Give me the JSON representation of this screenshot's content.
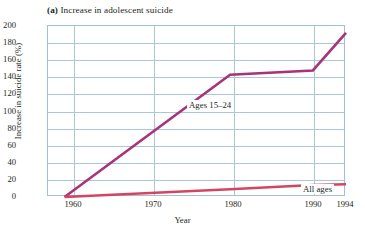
{
  "title": {
    "tag": "(a)",
    "text": " Increase in adolescent suicide"
  },
  "axes": {
    "xlabel": "Year",
    "ylabel": "Increase in suicide rate (%)",
    "ytick_labels": [
      "200",
      "180",
      "160",
      "140",
      "120",
      "100",
      "80",
      "60",
      "40",
      "20",
      "0"
    ],
    "xtick_labels": [
      "1960",
      "1970",
      "1980",
      "1990",
      "1994"
    ]
  },
  "colors": {
    "grid": "#a8c6de",
    "frame": "#9fc0da",
    "ages_15_24": "#a8337d",
    "all_ages": "#d4455f",
    "text": "#231f20",
    "background": "#ffffff"
  },
  "chart_data": {
    "type": "line",
    "title": "(a) Increase in adolescent suicide",
    "xlabel": "Year",
    "ylabel": "Increase in suicide rate (%)",
    "xlim": [
      1958,
      1994
    ],
    "ylim": [
      0,
      200
    ],
    "xticks": [
      1960,
      1970,
      1980,
      1990,
      1994
    ],
    "yticks": [
      0,
      20,
      40,
      60,
      80,
      100,
      120,
      140,
      160,
      180,
      200
    ],
    "grid": true,
    "legend": "inline-annotations",
    "series": [
      {
        "name": "Ages 15–24",
        "color": "#a8337d",
        "x": [
          1960,
          1980,
          1990,
          1994
        ],
        "values": [
          0,
          143,
          148,
          192
        ]
      },
      {
        "name": "All ages",
        "color": "#d4455f",
        "x": [
          1960,
          1980,
          1990,
          1994
        ],
        "values": [
          0,
          9,
          14,
          15
        ]
      }
    ]
  }
}
